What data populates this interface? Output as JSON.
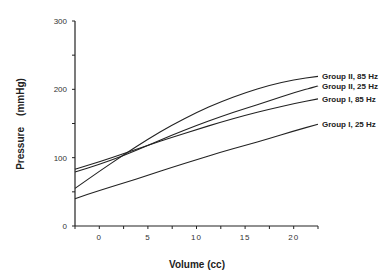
{
  "chart_data": {
    "type": "line",
    "title": "",
    "xlabel": "Volume (cc)",
    "ylabel": "Pressure (mmHg)",
    "xlim": [
      -2.5,
      22.5
    ],
    "ylim": [
      0,
      300
    ],
    "xticks": [
      "0",
      "5",
      "10",
      "15",
      "20"
    ],
    "yticks": [
      "0",
      "100",
      "200",
      "300"
    ],
    "grid": false,
    "legend_position": "right (inline labels at line ends)",
    "x": [
      -2.5,
      0,
      2.5,
      5,
      7.5,
      10,
      12.5,
      15,
      17.5,
      20,
      22.5
    ],
    "series": [
      {
        "name": "Group II, 85 Hz",
        "values": [
          55,
          80,
          104,
          127,
          148,
          166,
          182,
          195,
          206,
          214,
          219
        ]
      },
      {
        "name": "Group II, 25 Hz",
        "values": [
          79,
          90,
          103,
          118,
          133,
          147,
          160,
          172,
          183,
          195,
          205
        ]
      },
      {
        "name": "Group I, 85 Hz",
        "values": [
          83,
          94,
          106,
          118,
          130,
          141,
          152,
          162,
          171,
          179,
          186
        ]
      },
      {
        "name": "Group I, 25 Hz",
        "values": [
          40,
          52,
          63,
          74,
          86,
          97,
          108,
          118,
          128,
          139,
          149
        ]
      }
    ]
  },
  "labels": {
    "xlabel": "Volume (cc)",
    "ylabel": "Pressure    (mmHg)",
    "legend": [
      "Group II, 85 Hz",
      "Group II, 25 Hz",
      "Group I, 85 Hz",
      "Group I, 25 Hz"
    ],
    "xticks": [
      "0",
      "5",
      "10",
      "15",
      "20"
    ],
    "yticks": [
      "0",
      "100",
      "200",
      "300"
    ]
  }
}
